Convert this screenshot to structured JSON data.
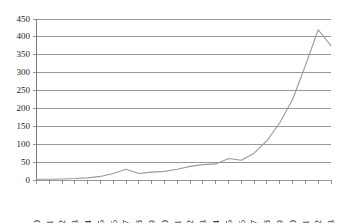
{
  "chart_data": {
    "type": "line",
    "title": "",
    "subtitle": "",
    "xlabel": "",
    "ylabel": "",
    "grid": true,
    "legend": false,
    "legend_position": "none",
    "line_color": "#9b9b9b",
    "axis_color": "#6d6e70",
    "text_color": "#231f20",
    "background_color": "#ffffff",
    "xlim": [
      1990,
      2013
    ],
    "ylim": [
      0,
      450
    ],
    "ytick_step": 50,
    "categories": [
      "1990",
      "1991",
      "1992",
      "1993",
      "1994",
      "1995",
      "1996",
      "1997",
      "1998",
      "1999",
      "2000",
      "2001",
      "2002",
      "2003",
      "2004",
      "2005",
      "2006",
      "2007",
      "2008",
      "2009",
      "2010",
      "2011",
      "2012",
      "2013"
    ],
    "ytick_labels": [
      "0",
      "50",
      "100",
      "150",
      "200",
      "250",
      "300",
      "350",
      "400",
      "450"
    ],
    "ytick_values": [
      0,
      50,
      100,
      150,
      200,
      250,
      300,
      350,
      400,
      450
    ],
    "values": [
      2,
      2,
      3,
      4,
      6,
      10,
      18,
      30,
      18,
      22,
      24,
      30,
      38,
      43,
      45,
      60,
      55,
      75,
      110,
      160,
      225,
      320,
      420,
      375
    ],
    "series": [
      {
        "name": "series-1",
        "values": [
          2,
          2,
          3,
          4,
          6,
          10,
          18,
          30,
          18,
          22,
          24,
          30,
          38,
          43,
          45,
          60,
          55,
          75,
          110,
          160,
          225,
          320,
          420,
          375
        ]
      }
    ],
    "annotations": []
  }
}
